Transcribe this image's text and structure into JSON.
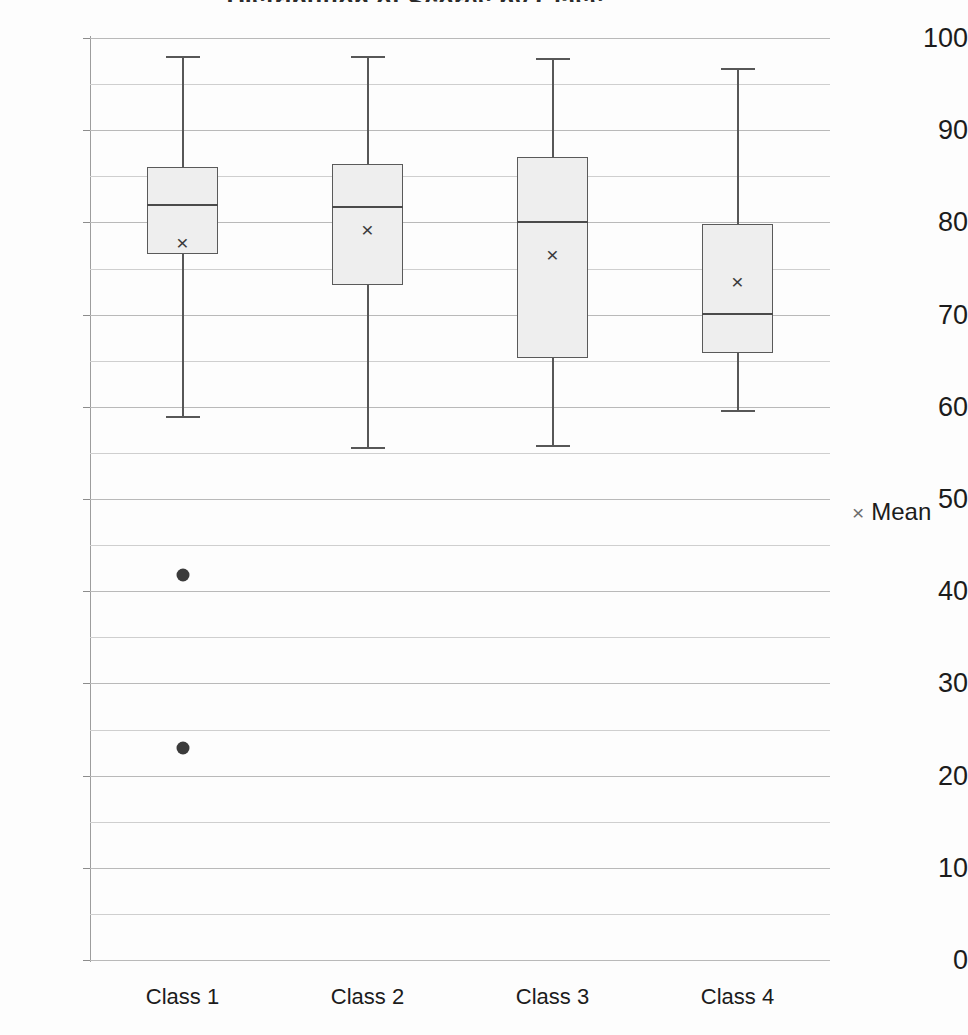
{
  "chart_data": {
    "type": "box",
    "title": "Distribution of Scores by Class",
    "xlabel": "",
    "ylabel": "",
    "ylim": [
      0,
      100
    ],
    "y_major_step": 10,
    "y_minor_step": 5,
    "grid": true,
    "categories": [
      "Class 1",
      "Class 2",
      "Class 3",
      "Class 4"
    ],
    "y_tick_labels": [
      "100",
      "90",
      "80",
      "70",
      "60",
      "50",
      "40",
      "30",
      "20",
      "10",
      "0"
    ],
    "legend": {
      "position": "right",
      "entries": [
        {
          "marker": "x-marker",
          "marker_glyph": "×",
          "label": "Mean"
        }
      ]
    },
    "boxes": [
      {
        "category": "Class 1",
        "whisker_high": 98.0,
        "q3": 86.0,
        "median": 82.0,
        "q1": 76.6,
        "whisker_low": 59.0,
        "mean": 77.9,
        "outliers": [
          41.8,
          23.0
        ]
      },
      {
        "category": "Class 2",
        "whisker_high": 98.0,
        "q3": 86.3,
        "median": 81.8,
        "q1": 73.2,
        "whisker_low": 55.6,
        "mean": 79.3,
        "outliers": []
      },
      {
        "category": "Class 3",
        "whisker_high": 97.8,
        "q3": 87.1,
        "median": 80.2,
        "q1": 65.3,
        "whisker_low": 55.9,
        "mean": 76.6,
        "outliers": []
      },
      {
        "category": "Class 4",
        "whisker_high": 96.8,
        "q3": 79.8,
        "median": 70.2,
        "q1": 65.8,
        "whisker_low": 59.7,
        "mean": 73.6,
        "outliers": []
      }
    ]
  }
}
